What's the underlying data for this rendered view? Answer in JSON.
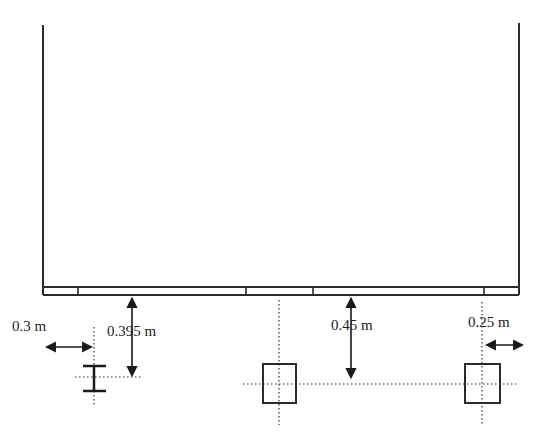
{
  "diagram": {
    "type": "structural cross-section",
    "elements": {
      "enclosure": {
        "left_wall": true,
        "right_wall": true,
        "beam_strip": true
      },
      "steel_section": {
        "shape": "I-beam"
      },
      "columns": [
        {
          "shape": "square"
        },
        {
          "shape": "square"
        }
      ]
    },
    "dimensions": {
      "left_offset": "0.3 m",
      "i_beam_depth": "0.395 m",
      "column_depth": "0.45 m",
      "right_offset": "0.25 m"
    }
  }
}
